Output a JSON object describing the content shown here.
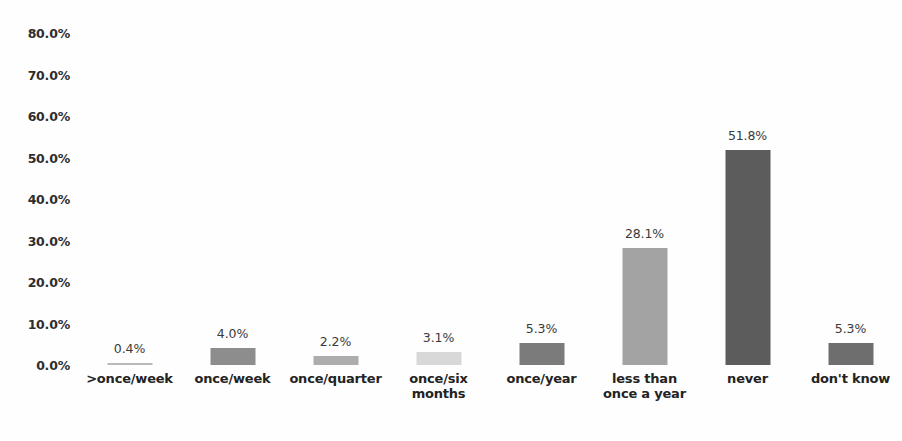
{
  "chart_data": {
    "type": "bar",
    "title": "",
    "subtitle": "",
    "xlabel": "",
    "ylabel": "",
    "ylim": [
      0,
      80
    ],
    "grid": false,
    "legend": "none",
    "y_ticks": [
      "0.0%",
      "10.0%",
      "20.0%",
      "30.0%",
      "40.0%",
      "50.0%",
      "60.0%",
      "70.0%",
      "80.0%"
    ],
    "y_tick_values": [
      0,
      10,
      20,
      30,
      40,
      50,
      60,
      70,
      80
    ],
    "categories": [
      ">once/week",
      "once/week",
      "once/quarter",
      "once/six months",
      "once/year",
      "less than once a year",
      "never",
      "don't know"
    ],
    "category_lines": [
      [
        ">once/week"
      ],
      [
        "once/week"
      ],
      [
        "once/quarter"
      ],
      [
        "once/six",
        "months"
      ],
      [
        "once/year"
      ],
      [
        "less than",
        "once a year"
      ],
      [
        "never"
      ],
      [
        "don't know"
      ]
    ],
    "values": [
      0.4,
      4.0,
      2.2,
      3.1,
      5.3,
      28.1,
      51.8,
      5.3
    ],
    "data_labels": [
      "0.4%",
      "4.0%",
      "2.2%",
      "3.1%",
      "5.3%",
      "28.1%",
      "51.8%",
      "5.3%"
    ],
    "bar_colors": [
      "#b9b9b9",
      "#8d8d8d",
      "#adadad",
      "#d8d8d8",
      "#7b7b7b",
      "#a3a3a3",
      "#5c5c5c",
      "#6e6e6e"
    ]
  },
  "colors": {
    "background": "#fefefe",
    "axis_text": "#2e2e2e",
    "label_text": "#3a3a3a",
    "category_text": "#232323"
  }
}
